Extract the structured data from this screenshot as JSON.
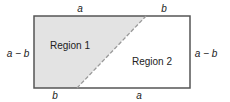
{
  "diagram": {
    "colors": {
      "region1_fill": "#e3e3e3",
      "border": "#555555",
      "dashed_line": "#9a9a9a",
      "text": "#222222"
    },
    "rectangle": {
      "x": 34,
      "y": 16,
      "width": 156,
      "height": 72
    },
    "diagonal": {
      "x1": 77,
      "y1": 88,
      "x2": 146,
      "y2": 16,
      "style": "dashed"
    },
    "regions": [
      {
        "label": "Region 1",
        "x": 70,
        "y": 49
      },
      {
        "label": "Region 2",
        "x": 152,
        "y": 65
      }
    ],
    "edge_labels": {
      "top_left": "a",
      "top_right": "b",
      "bottom_left": "b",
      "bottom_right": "a",
      "left": "a − b",
      "right": "a − b"
    }
  }
}
